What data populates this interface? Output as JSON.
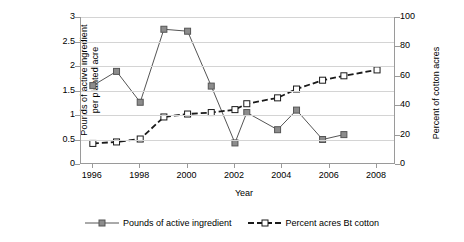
{
  "chart_data": {
    "type": "line",
    "title": "",
    "xlabel": "Year",
    "ylabel": "Pounds of active ingredient per planted acre",
    "ylabel_right": "Percent of cotton acres",
    "xlim": [
      1995.5,
      2008.8
    ],
    "ylim": [
      0,
      3
    ],
    "ylim_right": [
      0,
      100
    ],
    "grid": true,
    "legend_position": "bottom",
    "y_ticks_left": [
      "0",
      "0.5",
      "1",
      "1.5",
      "2",
      "2.5",
      "3"
    ],
    "y_ticks_right": [
      "0",
      "20",
      "40",
      "60",
      "80",
      "100"
    ],
    "x_ticks": [
      "1996",
      "1998",
      "2000",
      "2002",
      "2004",
      "2006",
      "2008"
    ],
    "series": [
      {
        "name": "Pounds of active ingredient",
        "axis": "left",
        "line_style": "solid",
        "marker": "filled-square",
        "color": "#555555",
        "marker_fill": "#8c8c8c",
        "x": [
          1996,
          1997,
          1998,
          1999,
          2000,
          2001,
          2002,
          2002.5,
          2003.8,
          2004.6,
          2005.7,
          2006.6
        ],
        "values": [
          1.6,
          1.89,
          1.26,
          2.75,
          2.71,
          1.59,
          0.43,
          1.05,
          0.7,
          1.1,
          0.5,
          0.6
        ]
      },
      {
        "name": "Percent acres Bt cotton",
        "axis": "right",
        "line_style": "dashed",
        "marker": "open-square",
        "color": "#1a1a1a",
        "marker_fill": "#ffffff",
        "x": [
          1996,
          1997,
          1998,
          1999,
          2000,
          2001,
          2002,
          2002.5,
          2003.8,
          2004.6,
          2005.7,
          2006.6,
          2008
        ],
        "values": [
          14,
          15,
          17,
          32,
          34,
          35,
          37,
          41,
          45,
          51,
          57,
          60,
          64
        ]
      }
    ]
  },
  "legend": {
    "items": [
      {
        "label": "Pounds of active ingredient"
      },
      {
        "label": "Percent acres Bt cotton"
      }
    ]
  }
}
